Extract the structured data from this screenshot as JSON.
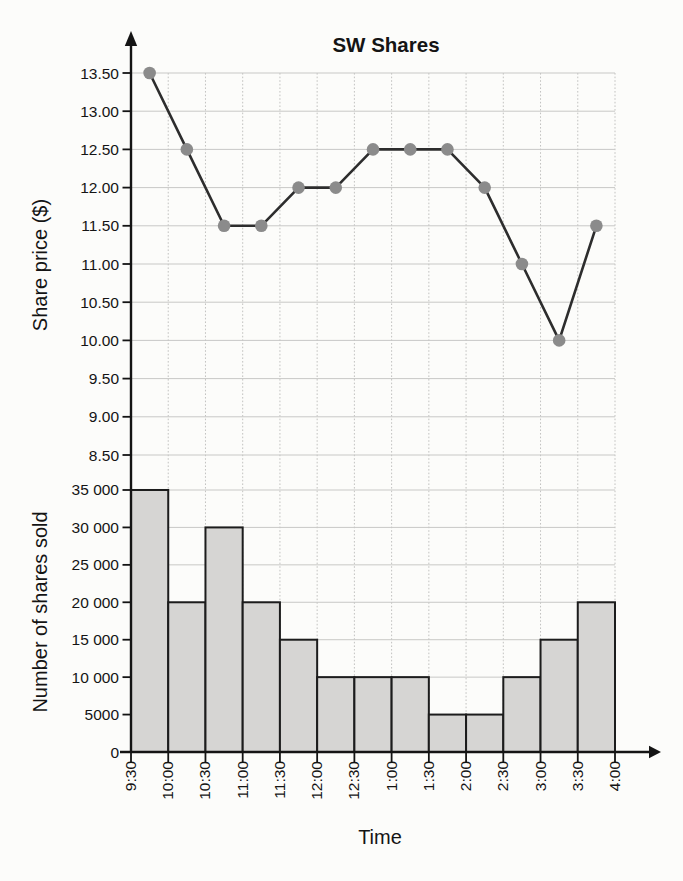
{
  "chart": {
    "title": "SW Shares",
    "colors": {
      "background": "#fcfcfa",
      "bar_fill": "#d6d5d3",
      "bar_stroke": "#1c1c1c",
      "line": "#2d2d2d",
      "point": "#8b8b8b",
      "grid_h": "#c8c8c6",
      "grid_v": "#c2c2c0",
      "axis": "#141414",
      "text": "#141414"
    }
  },
  "chart_data": [
    {
      "type": "line",
      "title": "SW Shares",
      "ylabel": "Share price ($)",
      "series_name": "Share price",
      "x_tick_labels": [
        "9:30",
        "10:00",
        "10:30",
        "11:00",
        "11:30",
        "12:00",
        "12:30",
        "1:00",
        "1:30",
        "2:00",
        "2:30",
        "3:00",
        "3:30",
        "4:00"
      ],
      "categories": [
        "9:30-10:00",
        "10:00-10:30",
        "10:30-11:00",
        "11:00-11:30",
        "11:30-12:00",
        "12:00-12:30",
        "12:30-1:00",
        "1:00-1:30",
        "1:30-2:00",
        "2:00-2:30",
        "2:30-3:00",
        "3:00-3:30",
        "3:30-4:00"
      ],
      "values": [
        13.5,
        12.5,
        11.5,
        11.5,
        12.0,
        12.0,
        12.5,
        12.5,
        12.5,
        12.0,
        11.0,
        10.0,
        11.5
      ],
      "ylim": [
        8.5,
        13.5
      ],
      "ytick_step": 0.5,
      "ytick_labels": [
        "13.50",
        "13.00",
        "12.50",
        "12.00",
        "11.50",
        "11.00",
        "10.50",
        "10.00",
        "9.50",
        "9.00",
        "8.50"
      ],
      "grid": true,
      "legend": "none",
      "note": "points plotted at the midpoint of each half-hour interval"
    },
    {
      "type": "bar",
      "ylabel": "Number of shares sold",
      "xlabel": "Time",
      "categories": [
        "9:30-10:00",
        "10:00-10:30",
        "10:30-11:00",
        "11:00-11:30",
        "11:30-12:00",
        "12:00-12:30",
        "12:30-1:00",
        "1:00-1:30",
        "1:30-2:00",
        "2:00-2:30",
        "2:30-3:00",
        "3:00-3:30",
        "3:30-4:00"
      ],
      "values": [
        35000,
        20000,
        30000,
        20000,
        15000,
        10000,
        10000,
        10000,
        5000,
        5000,
        10000,
        15000,
        20000
      ],
      "ylim": [
        0,
        35000
      ],
      "ytick_step": 5000,
      "ytick_labels": [
        "35 000",
        "30 000",
        "25 000",
        "20 000",
        "15 000",
        "10 000",
        "5000",
        "0"
      ],
      "grid": true,
      "legend": "none"
    }
  ]
}
